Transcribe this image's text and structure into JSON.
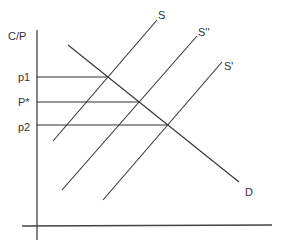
{
  "diagram": {
    "type": "supply-demand",
    "y_axis_label": "C/P",
    "price_levels": [
      {
        "id": "p1",
        "label": "p1"
      },
      {
        "id": "pstar",
        "label": "P*"
      },
      {
        "id": "p2",
        "label": "p2"
      }
    ],
    "curves": [
      {
        "id": "S",
        "label": "S",
        "kind": "supply"
      },
      {
        "id": "S2",
        "label": "S''",
        "kind": "supply"
      },
      {
        "id": "S1",
        "label": "S'",
        "kind": "supply"
      },
      {
        "id": "D",
        "label": "D",
        "kind": "demand"
      }
    ],
    "colors": {
      "line": "#333333",
      "background": "#ffffff"
    }
  }
}
